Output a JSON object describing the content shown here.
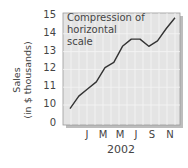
{
  "chart_data": {
    "type": "line",
    "title": "",
    "annotation": "Compression of horizontal scale",
    "annotation_lines": [
      "Compression of",
      "horizontal",
      "scale"
    ],
    "xlabel": "2002",
    "ylabel": "Sales",
    "ylabel_sub": "(in $ thousands)",
    "x_tick_labels": [
      "J",
      "M",
      "M",
      "J",
      "S",
      "N"
    ],
    "y_tick_labels": [
      "15",
      "14",
      "13",
      "12",
      "11",
      "10",
      "0"
    ],
    "ylim": [
      0,
      15
    ],
    "axis_break": "between 0 and 10",
    "grid": true,
    "series": [
      {
        "name": "Sales",
        "x": [
          0,
          1,
          2,
          3,
          4,
          5,
          6,
          7,
          8,
          9,
          10,
          11,
          12
        ],
        "values": [
          9.8,
          10.5,
          10.9,
          11.3,
          12.1,
          12.4,
          13.3,
          13.7,
          13.7,
          13.3,
          13.6,
          14.3,
          14.9
        ]
      }
    ],
    "colors": {
      "line": "#333333",
      "plot_bg": "#e4e4e4",
      "grid": "#f4f4f4",
      "shadow": "#bdbdbd"
    }
  }
}
